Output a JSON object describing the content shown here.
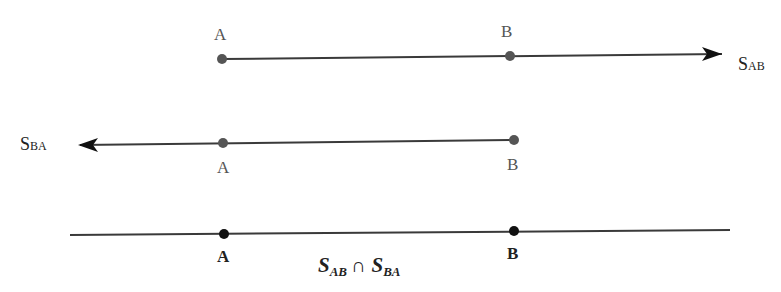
{
  "diagram": {
    "colors": {
      "line": "#3a3a3a",
      "point_gray": "#555555",
      "point_black": "#111111",
      "text_gray": "#555555",
      "text_dark": "#222222"
    },
    "ray_ab": {
      "point_a_label": "A",
      "point_b_label": "B",
      "name_main": "S",
      "name_sub": "AB"
    },
    "ray_ba": {
      "point_a_label": "A",
      "point_b_label": "B",
      "name_main": "S",
      "name_sub": "BA"
    },
    "intersection_line": {
      "point_a_label": "A",
      "point_b_label": "B",
      "expr_s1": "S",
      "expr_sub1": "AB",
      "expr_op": "∩",
      "expr_s2": "S",
      "expr_sub2": "BA"
    }
  }
}
